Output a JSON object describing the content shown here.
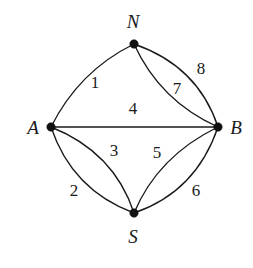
{
  "figure": {
    "name": "multigraph-konigsberg-style",
    "width": 253,
    "height": 268,
    "background_color": "#ffffff",
    "stroke_color": "#1a1a1a"
  },
  "vertices": [
    {
      "id": "N",
      "label": "N",
      "x": 134,
      "y": 44,
      "label_x": 133,
      "label_y": 21
    },
    {
      "id": "A",
      "label": "A",
      "x": 51,
      "y": 127,
      "label_x": 33,
      "label_y": 127
    },
    {
      "id": "B",
      "label": "B",
      "x": 218,
      "y": 127,
      "label_x": 236,
      "label_y": 127
    },
    {
      "id": "S",
      "label": "S",
      "x": 134,
      "y": 213,
      "label_x": 133,
      "label_y": 236
    }
  ],
  "edges": [
    {
      "id": "e1",
      "label": "1",
      "from": "A",
      "to": "N",
      "shape": "curve",
      "bulge": "outward",
      "path": "M 51 127 Q 79 71 134 44",
      "label_x": 95,
      "label_y": 82
    },
    {
      "id": "e2",
      "label": "2",
      "from": "A",
      "to": "S",
      "shape": "curve",
      "bulge": "outward",
      "path": "M 51 127 Q 72 190 134 213",
      "label_x": 74,
      "label_y": 190
    },
    {
      "id": "e3",
      "label": "3",
      "from": "A",
      "to": "S",
      "shape": "curve",
      "bulge": "inward",
      "path": "M 51 127 Q 114 152 134 213",
      "label_x": 114,
      "label_y": 150
    },
    {
      "id": "e4",
      "label": "4",
      "from": "A",
      "to": "B",
      "shape": "straight",
      "bulge": "none",
      "path": "M 51 127 L 218 127",
      "label_x": 133,
      "label_y": 108
    },
    {
      "id": "e5",
      "label": "5",
      "from": "S",
      "to": "B",
      "shape": "curve",
      "bulge": "inward",
      "path": "M 134 213 Q 158 156 218 127",
      "label_x": 157,
      "label_y": 152
    },
    {
      "id": "e6",
      "label": "6",
      "from": "S",
      "to": "B",
      "shape": "curve",
      "bulge": "outward",
      "path": "M 134 213 Q 196 192 218 127",
      "label_x": 196,
      "label_y": 190
    },
    {
      "id": "e7",
      "label": "7",
      "from": "N",
      "to": "B",
      "shape": "curve",
      "bulge": "inward",
      "path": "M 134 44 Q 160 101 218 127",
      "label_x": 177,
      "label_y": 88
    },
    {
      "id": "e8",
      "label": "8",
      "from": "N",
      "to": "B",
      "shape": "curve",
      "bulge": "outward",
      "path": "M 134 44 Q 198 66 218 127",
      "label_x": 201,
      "label_y": 68
    }
  ]
}
